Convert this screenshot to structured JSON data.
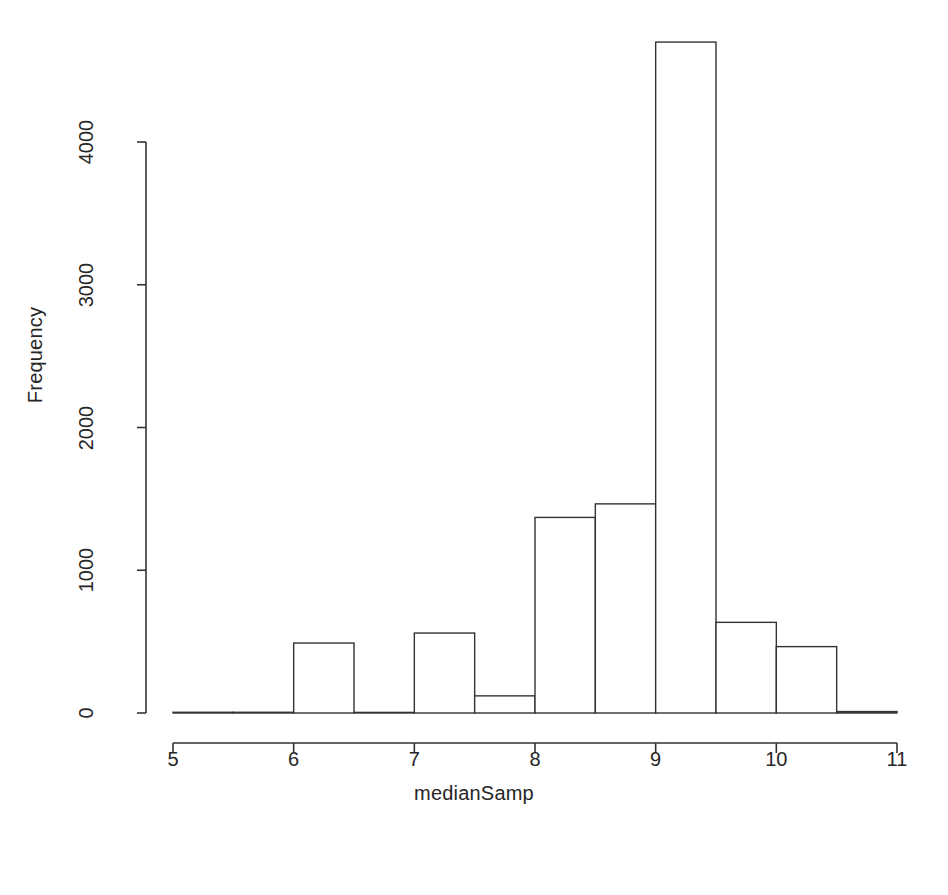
{
  "chart_data": {
    "type": "bar",
    "title": "",
    "subtitle": "",
    "xlabel": "medianSamp",
    "ylabel": "Frequency",
    "xlim": [
      5,
      11
    ],
    "ylim": [
      0,
      4700
    ],
    "grid": false,
    "legend": "none",
    "bin_width": 0.5,
    "bin_edges": [
      5.0,
      5.5,
      6.0,
      6.5,
      7.0,
      7.5,
      8.0,
      8.5,
      9.0,
      9.5,
      10.0,
      10.5,
      11.0
    ],
    "categories": [
      "5-5.5",
      "5.5-6",
      "6-6.5",
      "6.5-7",
      "7-7.5",
      "7.5-8",
      "8-8.5",
      "8.5-9",
      "9-9.5",
      "9.5-10",
      "10-10.5",
      "10.5-11"
    ],
    "values": [
      5,
      5,
      490,
      0,
      560,
      120,
      1370,
      1465,
      4700,
      635,
      465,
      10
    ],
    "x_ticks": [
      5,
      6,
      7,
      8,
      9,
      10,
      11
    ],
    "x_tick_labels": [
      "5",
      "6",
      "7",
      "8",
      "9",
      "10",
      "11"
    ],
    "y_ticks": [
      0,
      1000,
      2000,
      3000,
      4000
    ],
    "y_tick_labels": [
      "0",
      "1000",
      "2000",
      "3000",
      "4000"
    ],
    "bar_fill_color": "#ffffff",
    "bar_stroke_color": "#333333",
    "axis_color": "#333333",
    "background_color": "#ffffff"
  },
  "figure": {
    "caption": ""
  }
}
